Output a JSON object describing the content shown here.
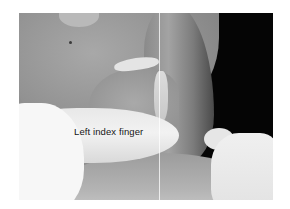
{
  "figure": {
    "type": "grayscale clinical photograph",
    "annotation": {
      "label": "Left index finger"
    },
    "colors": {
      "background": "#ffffff",
      "dark_area": "#050505",
      "glove": "#f2f2f2",
      "label_text": "#151515"
    }
  }
}
